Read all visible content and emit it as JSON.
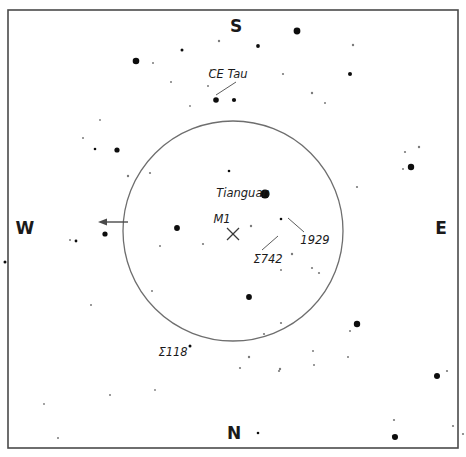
{
  "chart_data": {
    "type": "scatter",
    "title": "",
    "subtitle": "",
    "xlabel": "",
    "ylabel": "",
    "grid": false,
    "legend_position": "none",
    "field_of_view_circle": {
      "center_x": 233,
      "center_y": 231,
      "radius": 110,
      "stroke": "#6e6e6e"
    },
    "cardinal_directions": [
      {
        "label": "S",
        "x": 236,
        "y": 27
      },
      {
        "label": "W",
        "x": 25,
        "y": 229
      },
      {
        "label": "E",
        "x": 441,
        "y": 229
      },
      {
        "label": "N",
        "x": 234,
        "y": 434
      }
    ],
    "annotations": [
      {
        "label": "CE Tau",
        "text_x": 228,
        "text_y": 74,
        "leader": {
          "x1": 216,
          "y1": 95,
          "x2": 236,
          "y2": 82
        },
        "has_leader": true
      },
      {
        "label": "Tianguan",
        "text_x": 243,
        "text_y": 193,
        "has_leader": false
      },
      {
        "label": "M1",
        "text_x": 222,
        "text_y": 219,
        "has_leader": false
      },
      {
        "label": "Σ742",
        "text_x": 268,
        "text_y": 259,
        "leader": {
          "x1": 262,
          "y1": 250,
          "x2": 278,
          "y2": 236
        },
        "has_leader": true
      },
      {
        "label": "1929",
        "text_x": 315,
        "text_y": 240,
        "leader": {
          "x1": 304,
          "y1": 232,
          "x2": 288,
          "y2": 218
        },
        "has_leader": true
      },
      {
        "label": "Σ118",
        "text_x": 173,
        "text_y": 352,
        "has_leader": false
      }
    ],
    "target_marker": {
      "name": "M1",
      "symbol": "X",
      "x": 233,
      "y": 234,
      "size": 6
    },
    "west_arrow": {
      "from_x": 128,
      "from_y": 222,
      "to_x": 98,
      "to_y": 222,
      "direction": "west"
    },
    "magnitude_scale_note": "Dot radius encodes stellar magnitude: larger dot = brighter star.",
    "stars": [
      {
        "x": 297,
        "y": 31,
        "r": 3.4
      },
      {
        "x": 258,
        "y": 46,
        "r": 1.9
      },
      {
        "x": 136,
        "y": 61,
        "r": 3.3
      },
      {
        "x": 182,
        "y": 50,
        "r": 1.5
      },
      {
        "x": 219,
        "y": 41,
        "r": 1.2
      },
      {
        "x": 153,
        "y": 63,
        "r": 1.0
      },
      {
        "x": 350,
        "y": 74,
        "r": 2.0
      },
      {
        "x": 322,
        "y": 0,
        "r": 0
      },
      {
        "x": 171,
        "y": 82,
        "r": 1.0
      },
      {
        "x": 211,
        "y": 70,
        "r": 1.1
      },
      {
        "x": 353,
        "y": 45,
        "r": 1.2
      },
      {
        "x": 216,
        "y": 100,
        "r": 2.8
      },
      {
        "x": 234,
        "y": 100,
        "r": 2.1
      },
      {
        "x": 208,
        "y": 86,
        "r": 1.0
      },
      {
        "x": 190,
        "y": 106,
        "r": 0.9
      },
      {
        "x": 283,
        "y": 74,
        "r": 1.1
      },
      {
        "x": 312,
        "y": 93,
        "r": 1.2
      },
      {
        "x": 325,
        "y": 103,
        "r": 1.0
      },
      {
        "x": 405,
        "y": 152,
        "r": 1.1
      },
      {
        "x": 419,
        "y": 147,
        "r": 1.2
      },
      {
        "x": 411,
        "y": 167,
        "r": 3.2
      },
      {
        "x": 403,
        "y": 169,
        "r": 1.0
      },
      {
        "x": 357,
        "y": 187,
        "r": 1.1
      },
      {
        "x": 83,
        "y": 138,
        "r": 1.0
      },
      {
        "x": 95,
        "y": 149,
        "r": 1.3
      },
      {
        "x": 117,
        "y": 150,
        "r": 2.6
      },
      {
        "x": 100,
        "y": 120,
        "r": 0.9
      },
      {
        "x": 128,
        "y": 176,
        "r": 1.2
      },
      {
        "x": 150,
        "y": 173,
        "r": 1.1
      },
      {
        "x": 229,
        "y": 171,
        "r": 1.3
      },
      {
        "x": 265,
        "y": 194,
        "r": 4.6
      },
      {
        "x": 177,
        "y": 228,
        "r": 2.9
      },
      {
        "x": 251,
        "y": 226,
        "r": 1.2
      },
      {
        "x": 281,
        "y": 219,
        "r": 1.3
      },
      {
        "x": 203,
        "y": 244,
        "r": 1.1
      },
      {
        "x": 105,
        "y": 234,
        "r": 2.6
      },
      {
        "x": 76,
        "y": 241,
        "r": 1.4
      },
      {
        "x": 5,
        "y": 262,
        "r": 1.5
      },
      {
        "x": 249,
        "y": 297,
        "r": 2.9
      },
      {
        "x": 292,
        "y": 254,
        "r": 1.2
      },
      {
        "x": 312,
        "y": 268,
        "r": 1.1
      },
      {
        "x": 281,
        "y": 270,
        "r": 1.0
      },
      {
        "x": 319,
        "y": 273,
        "r": 1.1
      },
      {
        "x": 190,
        "y": 346,
        "r": 1.5
      },
      {
        "x": 152,
        "y": 291,
        "r": 1.0
      },
      {
        "x": 70,
        "y": 240,
        "r": 1.0
      },
      {
        "x": 160,
        "y": 246,
        "r": 1.0
      },
      {
        "x": 91,
        "y": 305,
        "r": 1.0
      },
      {
        "x": 357,
        "y": 324,
        "r": 3.2
      },
      {
        "x": 350,
        "y": 331,
        "r": 1.0
      },
      {
        "x": 281,
        "y": 323,
        "r": 1.1
      },
      {
        "x": 314,
        "y": 365,
        "r": 1.0
      },
      {
        "x": 249,
        "y": 357,
        "r": 1.2
      },
      {
        "x": 280,
        "y": 369,
        "r": 1.2
      },
      {
        "x": 279,
        "y": 371,
        "r": 1.1
      },
      {
        "x": 313,
        "y": 351,
        "r": 1.0
      },
      {
        "x": 240,
        "y": 368,
        "r": 1.1
      },
      {
        "x": 264,
        "y": 334,
        "r": 1.1
      },
      {
        "x": 437,
        "y": 376,
        "r": 3.0
      },
      {
        "x": 447,
        "y": 371,
        "r": 1.1
      },
      {
        "x": 348,
        "y": 357,
        "r": 1.0
      },
      {
        "x": 394,
        "y": 420,
        "r": 1.1
      },
      {
        "x": 393,
        "y": 436,
        "r": 1.2
      },
      {
        "x": 395,
        "y": 437,
        "r": 3.0
      },
      {
        "x": 453,
        "y": 426,
        "r": 1.1
      },
      {
        "x": 463,
        "y": 434,
        "r": 1.1
      },
      {
        "x": 258,
        "y": 433,
        "r": 1.3
      },
      {
        "x": 155,
        "y": 390,
        "r": 0.9
      },
      {
        "x": 110,
        "y": 395,
        "r": 1.0
      },
      {
        "x": 58,
        "y": 438,
        "r": 1.0
      },
      {
        "x": 44,
        "y": 404,
        "r": 0.9
      }
    ]
  },
  "frame": {
    "x": 8,
    "y": 10,
    "width": 450,
    "height": 438,
    "stroke": "#4a4a4a"
  }
}
